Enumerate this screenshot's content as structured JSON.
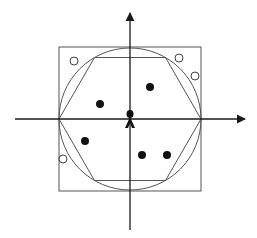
{
  "diagram": {
    "type": "cellular-cell-coverage",
    "colors": {
      "background": "#ffffff",
      "axis": "#1a1a1a",
      "shape_stroke": "#555555",
      "user_filled": "#111111",
      "user_hollow_stroke": "#444444",
      "tower": "#111111"
    },
    "axes": {
      "horizontal": {
        "x1": 15,
        "x2": 245,
        "y": 119
      },
      "vertical": {
        "x": 130,
        "y1": 13,
        "y2": 230
      }
    },
    "square": {
      "x": 59,
      "y": 47,
      "width": 142,
      "height": 144
    },
    "circle": {
      "cx": 130,
      "cy": 119,
      "r": 71
    },
    "hexagon": {
      "cx": 130,
      "cy": 119,
      "r": 71
    },
    "base_station": {
      "x": 130,
      "y": 119,
      "icon": "antenna-tower-icon"
    },
    "users_inside": [
      {
        "x": 100,
        "y": 104
      },
      {
        "x": 150,
        "y": 87
      },
      {
        "x": 85,
        "y": 141
      },
      {
        "x": 142,
        "y": 155
      },
      {
        "x": 167,
        "y": 155
      }
    ],
    "users_outside": [
      {
        "x": 74,
        "y": 61
      },
      {
        "x": 179,
        "y": 58
      },
      {
        "x": 195,
        "y": 76
      },
      {
        "x": 63,
        "y": 159
      }
    ]
  }
}
